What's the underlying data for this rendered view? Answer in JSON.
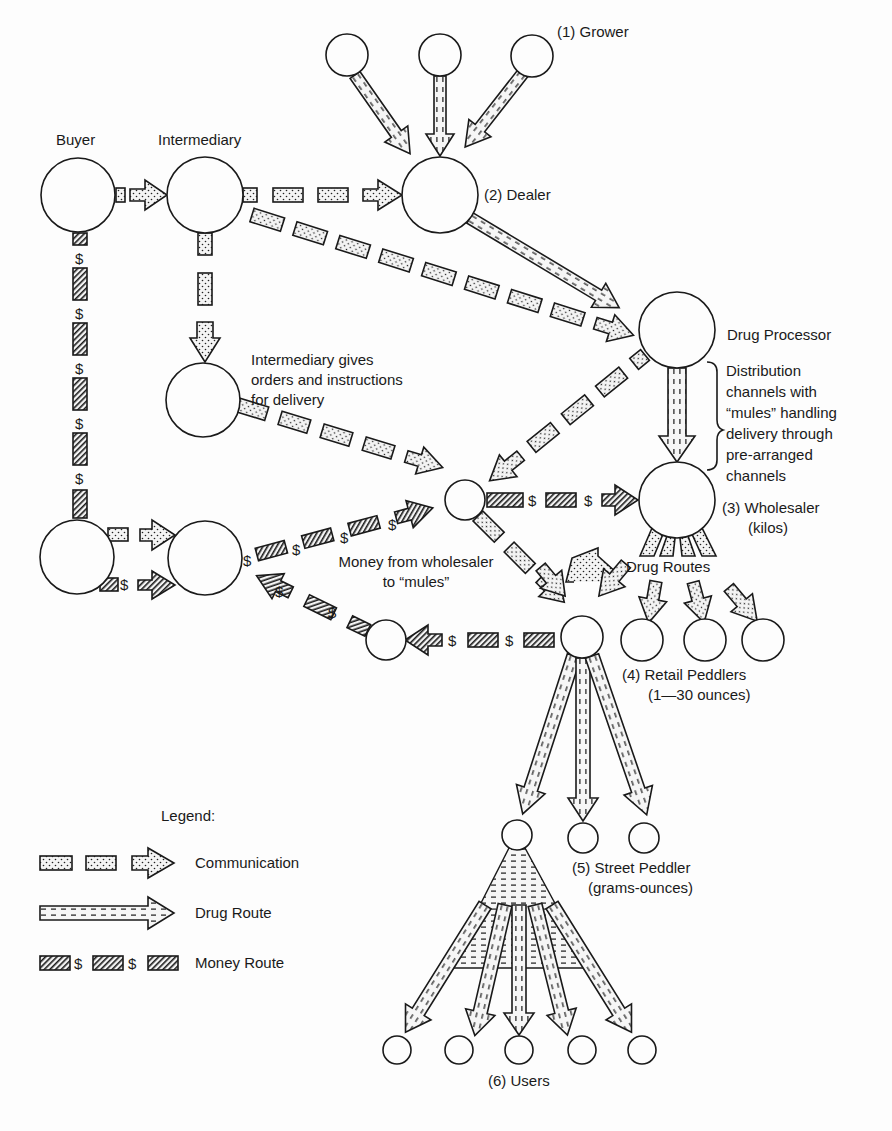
{
  "diagram": {
    "type": "flow-network",
    "colors": {
      "ink": "#1a1a1a",
      "paper": "#fdfdfd"
    },
    "nodes": {
      "grower": {
        "label": "(1) Grower"
      },
      "dealer": {
        "label": "(2) Dealer"
      },
      "buyer": {
        "label": "Buyer"
      },
      "intermediary": {
        "label": "Intermediary"
      },
      "intermediary_note": {
        "lines": [
          "Intermediary gives",
          "orders and instructions",
          "for delivery"
        ]
      },
      "drug_processor": {
        "label": "Drug Processor"
      },
      "distribution_note": {
        "lines": [
          "Distribution",
          "channels with",
          "“mules” handling",
          "delivery through",
          "pre-arranged",
          "channels"
        ]
      },
      "wholesaler": {
        "lines": [
          "(3) Wholesaler",
          "(kilos)"
        ]
      },
      "money_note": {
        "lines": [
          "Money from wholesaler",
          "to “mules”"
        ]
      },
      "drug_routes": {
        "label": "Drug Routes"
      },
      "retail_peddlers": {
        "lines": [
          "(4) Retail Peddlers",
          "(1—30 ounces)"
        ]
      },
      "street_peddler": {
        "lines": [
          "(5) Street Peddler",
          "(grams-ounces)"
        ]
      },
      "users": {
        "label": "(6) Users"
      }
    },
    "money_symbol": "$",
    "legend": {
      "title": "Legend:",
      "items": [
        {
          "key": "communication",
          "label": "Communication",
          "pattern": "dotted-dashed-arrow"
        },
        {
          "key": "drug_route",
          "label": "Drug Route",
          "pattern": "dashed-line-arrow"
        },
        {
          "key": "money_route",
          "label": "Money Route",
          "pattern": "hatched-dollar-dashes"
        }
      ]
    }
  }
}
